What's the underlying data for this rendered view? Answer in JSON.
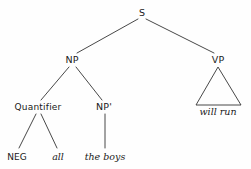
{
  "figure": {
    "type": "syntax-tree",
    "background_color": "#fefefe",
    "line_color": "#333333",
    "text_color": "#1a1a1a"
  },
  "nodes": {
    "s": {
      "label": "S",
      "x": 142,
      "y": 13
    },
    "np": {
      "label": "NP",
      "x": 72,
      "y": 60
    },
    "vp": {
      "label": "VP",
      "x": 218,
      "y": 60
    },
    "quantifier": {
      "label": "Quantifier",
      "x": 38,
      "y": 107
    },
    "np_bar": {
      "label": "NP'",
      "x": 104,
      "y": 107
    }
  },
  "terminals": {
    "neg": {
      "label": "NEG",
      "x": 17,
      "y": 157,
      "style": "upright"
    },
    "all": {
      "label": "all",
      "x": 58,
      "y": 157,
      "style": "italic"
    },
    "the_boys": {
      "label": "the boys",
      "x": 105,
      "y": 157,
      "style": "italic"
    },
    "will_run": {
      "label": "will run",
      "x": 218,
      "y": 112,
      "style": "italic"
    }
  },
  "edges": [
    {
      "name": "s-to-np",
      "x1": 138,
      "y1": 19,
      "x2": 77,
      "y2": 53
    },
    {
      "name": "s-to-vp",
      "x1": 146,
      "y1": 19,
      "x2": 214,
      "y2": 53
    },
    {
      "name": "np-to-quantifier",
      "x1": 69,
      "y1": 67,
      "x2": 41,
      "y2": 100
    },
    {
      "name": "np-to-npbar",
      "x1": 76,
      "y1": 67,
      "x2": 102,
      "y2": 100
    },
    {
      "name": "quantifier-to-neg",
      "x1": 36,
      "y1": 114,
      "x2": 19,
      "y2": 148
    },
    {
      "name": "quantifier-to-all",
      "x1": 41,
      "y1": 114,
      "x2": 57,
      "y2": 148
    },
    {
      "name": "npbar-to-theboys",
      "x1": 105,
      "y1": 114,
      "x2": 105,
      "y2": 148
    }
  ],
  "triangles": [
    {
      "name": "vp-triangle",
      "apex_x": 218,
      "apex_y": 67,
      "base_left_x": 196,
      "base_right_x": 241,
      "base_y": 105
    }
  ]
}
